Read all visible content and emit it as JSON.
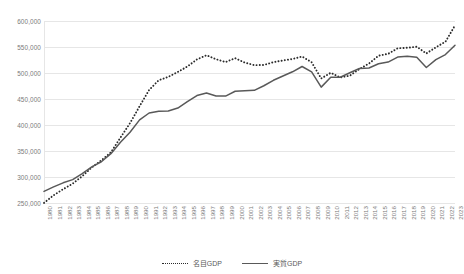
{
  "chart_data": {
    "type": "line",
    "title": "",
    "xlabel": "",
    "ylabel": "",
    "ylim": [
      250000,
      600000
    ],
    "ytick_step": 50000,
    "grid": true,
    "legend_position": "bottom-center",
    "ytick_labels": [
      "600,000",
      "550,000",
      "500,000",
      "450,000",
      "400,000",
      "350,000",
      "300,000",
      "250,000"
    ],
    "categories": [
      "1980",
      "1981",
      "1982",
      "1983",
      "1984",
      "1985",
      "1986",
      "1987",
      "1988",
      "1989",
      "1990",
      "1991",
      "1992",
      "1993",
      "1994",
      "1995",
      "1996",
      "1997",
      "1998",
      "1999",
      "2000",
      "2001",
      "2002",
      "2003",
      "2004",
      "2005",
      "2006",
      "2007",
      "2008",
      "2009",
      "2010",
      "2011",
      "2012",
      "2013",
      "2014",
      "2015",
      "2016",
      "2017",
      "2018",
      "2019",
      "2020",
      "2021",
      "2022",
      "2023"
    ],
    "series": [
      {
        "name": "名目GDP",
        "style": "dotted",
        "color": "#2b2b2b",
        "values": [
          250200,
          264800,
          276500,
          287200,
          301500,
          318400,
          332000,
          347500,
          375800,
          403600,
          436100,
          467400,
          486000,
          492500,
          502000,
          512500,
          526100,
          534100,
          526500,
          521000,
          528500,
          520000,
          515100,
          515400,
          520800,
          524100,
          526900,
          531700,
          520700,
          489500,
          500400,
          491400,
          494900,
          507600,
          518200,
          533200,
          536800,
          547500,
          548500,
          550500,
          537600,
          549400,
          560200,
          591500
        ]
      },
      {
        "name": "実質GDP",
        "style": "solid",
        "color": "#595959",
        "values": [
          272400,
          280900,
          288800,
          294900,
          306500,
          319600,
          329300,
          344900,
          367000,
          386000,
          409900,
          423100,
          426500,
          426900,
          432600,
          444800,
          456700,
          461700,
          455800,
          455600,
          464900,
          465800,
          466700,
          475500,
          486000,
          494300,
          502300,
          512500,
          502000,
          472800,
          492000,
          491900,
          500500,
          508700,
          509600,
          517800,
          521000,
          530700,
          532100,
          530300,
          510600,
          525800,
          535500,
          553400
        ]
      }
    ]
  },
  "legend": {
    "items": [
      {
        "label": "名目GDP",
        "style": "dotted"
      },
      {
        "label": "実質GDP",
        "style": "solid"
      }
    ]
  }
}
